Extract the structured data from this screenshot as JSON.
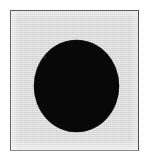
{
  "figure": {
    "caption": "",
    "canvas": {
      "width_px": 155,
      "height_px": 159,
      "background_color": "#ffffff"
    },
    "frame": {
      "label": "image-plate",
      "left_px": 10,
      "top_px": 10,
      "width_px": 129,
      "height_px": 141,
      "fill_color": "#dcdcdc",
      "border_color": "#555555",
      "border_width_px": 1.5
    },
    "shape": {
      "label": "solid-disc",
      "type": "ellipse",
      "fill_color": "#080808",
      "center_x_px": 75,
      "center_y_px": 85,
      "width_px": 85,
      "height_px": 92
    },
    "speck": {
      "label": "disc-speck",
      "color": "#5a5a5a"
    }
  }
}
